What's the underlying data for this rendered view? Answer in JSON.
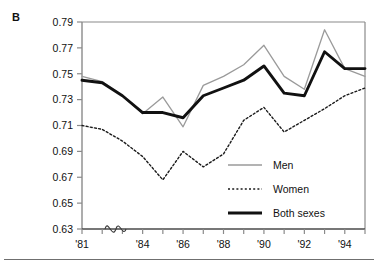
{
  "panel": {
    "label": "B"
  },
  "chart_data": {
    "type": "line",
    "title": "",
    "xlabel": "",
    "ylabel": "",
    "x": [
      1981,
      1982,
      1983,
      1984,
      1985,
      1986,
      1987,
      1988,
      1989,
      1990,
      1991,
      1992,
      1993,
      1994,
      1995
    ],
    "categories": [
      "'81",
      "'82",
      "'83",
      "'84",
      "'85",
      "'86",
      "'87",
      "'88",
      "'89",
      "'90",
      "'91",
      "'92",
      "'93",
      "'94",
      "'95"
    ],
    "xtick_labels": [
      "'81",
      "'84",
      "'86",
      "'88",
      "'90",
      "'92",
      "'94"
    ],
    "xtick_values": [
      1981,
      1984,
      1986,
      1988,
      1990,
      1992,
      1994
    ],
    "xlim": [
      1981,
      1995
    ],
    "ylim": [
      0.63,
      0.79
    ],
    "ytick_labels": [
      "0.63",
      "0.65",
      "0.67",
      "0.69",
      "0.71",
      "0.73",
      "0.75",
      "0.77",
      "0.79"
    ],
    "ytick_values": [
      0.63,
      0.65,
      0.67,
      0.69,
      0.71,
      0.73,
      0.75,
      0.77,
      0.79
    ],
    "grid": false,
    "axis_break_symbol": "wave",
    "legend_position": "center-right",
    "series": [
      {
        "name": "Men",
        "style": "solid-gray",
        "color": "#9a9a9a",
        "values": [
          0.748,
          0.744,
          0.733,
          0.719,
          0.732,
          0.709,
          0.741,
          0.748,
          0.757,
          0.772,
          0.748,
          0.738,
          0.784,
          0.754,
          0.748
        ]
      },
      {
        "name": "Women",
        "style": "dotted",
        "color": "#1a1a1a",
        "values": [
          0.71,
          0.707,
          0.698,
          0.686,
          0.668,
          0.69,
          0.678,
          0.688,
          0.714,
          0.724,
          0.705,
          0.714,
          0.723,
          0.733,
          0.739
        ]
      },
      {
        "name": "Both sexes",
        "style": "solid-thick-black",
        "color": "#111111",
        "values": [
          0.745,
          0.743,
          0.733,
          0.72,
          0.72,
          0.716,
          0.733,
          0.739,
          0.745,
          0.756,
          0.735,
          0.733,
          0.767,
          0.754,
          0.754
        ]
      }
    ],
    "legend": [
      {
        "label": "Men",
        "style": "solid-gray",
        "color": "#9a9a9a"
      },
      {
        "label": "Women",
        "style": "dotted",
        "color": "#1a1a1a"
      },
      {
        "label": "Both sexes",
        "style": "solid-thick-black",
        "color": "#111111"
      }
    ]
  }
}
